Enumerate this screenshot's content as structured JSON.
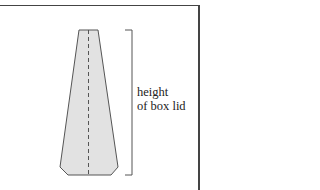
{
  "diagram": {
    "label": {
      "line1": "height",
      "line2": "of box lid"
    },
    "colors": {
      "shape_fill": "#e2e2e2",
      "shape_stroke": "#555555",
      "fold_line": "#555555",
      "bracket": "#555555",
      "border": "#444444"
    }
  }
}
